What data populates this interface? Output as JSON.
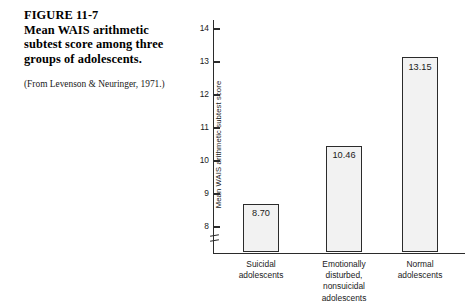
{
  "caption": {
    "figure_number": "FIGURE 11-7",
    "title": "Mean WAIS arithmetic subtest score among three groups of adolescents.",
    "source": "(From Levenson & Neuringer, 1971.)"
  },
  "chart_data": {
    "type": "bar",
    "title": "Mean WAIS arithmetic subtest score among three groups of adolescents.",
    "xlabel": "",
    "ylabel": "Mean WAIS arithmetic subtest score",
    "categories": [
      "Suicidal adolescents",
      "Emotionally disturbed, nonsuicidal adolescents",
      "Normal adolescents"
    ],
    "category_lines": [
      [
        "Suicidal",
        "adolescents"
      ],
      [
        "Emotionally",
        "disturbed,",
        "nonsuicidal",
        "adolescents"
      ],
      [
        "Normal",
        "adolescents"
      ]
    ],
    "values": [
      8.7,
      10.46,
      13.15
    ],
    "value_labels": [
      "8.70",
      "10.46",
      "13.15"
    ],
    "ylim": [
      7.6,
      14.4
    ],
    "yticks": [
      8,
      9,
      10,
      11,
      12,
      13,
      14
    ],
    "ytick_labels": [
      "8",
      "9",
      "10",
      "11",
      "12",
      "13",
      "14"
    ],
    "axis_break": true,
    "grid": false,
    "legend": null,
    "bar_fill": "#f2f2f2",
    "bar_border": "#2b2b2b"
  }
}
